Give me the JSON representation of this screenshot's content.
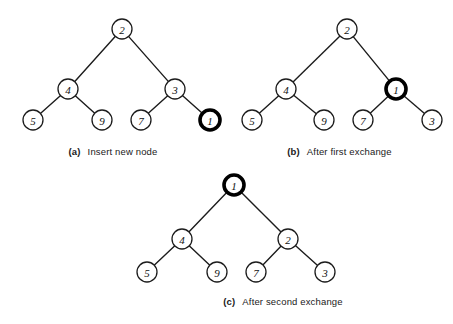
{
  "figure": {
    "type": "diagram",
    "background_color": "#ffffff",
    "node_stroke_color": "#1c1c1c",
    "node_fill_color": "#ffffff",
    "highlight_stroke_color": "#000000",
    "edge_color": "#1c1c1c"
  },
  "panels": [
    {
      "id": "a",
      "caption_tag": "(a)",
      "caption_text": "Insert new node",
      "width": 226,
      "height": 162,
      "nodes": [
        {
          "id": "a-root",
          "label": "2",
          "x": 122,
          "y": 29,
          "r": 10,
          "highlighted": false
        },
        {
          "id": "a-n4",
          "label": "4",
          "x": 68,
          "y": 89,
          "r": 10,
          "highlighted": false
        },
        {
          "id": "a-n3",
          "label": "3",
          "x": 175,
          "y": 89,
          "r": 10,
          "highlighted": false
        },
        {
          "id": "a-n5",
          "label": "5",
          "x": 33,
          "y": 120,
          "r": 10,
          "highlighted": false
        },
        {
          "id": "a-n9",
          "label": "9",
          "x": 102,
          "y": 120,
          "r": 10,
          "highlighted": false
        },
        {
          "id": "a-n7",
          "label": "7",
          "x": 141,
          "y": 120,
          "r": 10,
          "highlighted": false
        },
        {
          "id": "a-n1",
          "label": "1",
          "x": 210,
          "y": 120,
          "r": 10,
          "highlighted": true
        }
      ],
      "edges": [
        {
          "from": "a-root",
          "to": "a-n4"
        },
        {
          "from": "a-root",
          "to": "a-n3"
        },
        {
          "from": "a-n4",
          "to": "a-n5"
        },
        {
          "from": "a-n4",
          "to": "a-n9"
        },
        {
          "from": "a-n3",
          "to": "a-n7"
        },
        {
          "from": "a-n3",
          "to": "a-n1"
        }
      ]
    },
    {
      "id": "b",
      "caption_tag": "(b)",
      "caption_text": "After first exchange",
      "width": 227,
      "height": 162,
      "nodes": [
        {
          "id": "b-root",
          "label": "2",
          "x": 121,
          "y": 29,
          "r": 10,
          "highlighted": false
        },
        {
          "id": "b-n4",
          "label": "4",
          "x": 60,
          "y": 89,
          "r": 10,
          "highlighted": false
        },
        {
          "id": "b-n1",
          "label": "1",
          "x": 170,
          "y": 89,
          "r": 10,
          "highlighted": true
        },
        {
          "id": "b-n5",
          "label": "5",
          "x": 26,
          "y": 120,
          "r": 10,
          "highlighted": false
        },
        {
          "id": "b-n9",
          "label": "9",
          "x": 98,
          "y": 120,
          "r": 10,
          "highlighted": false
        },
        {
          "id": "b-n7",
          "label": "7",
          "x": 137,
          "y": 120,
          "r": 10,
          "highlighted": false
        },
        {
          "id": "b-n3",
          "label": "3",
          "x": 206,
          "y": 120,
          "r": 10,
          "highlighted": false
        }
      ],
      "edges": [
        {
          "from": "b-root",
          "to": "b-n4"
        },
        {
          "from": "b-root",
          "to": "b-n1"
        },
        {
          "from": "b-n4",
          "to": "b-n5"
        },
        {
          "from": "b-n4",
          "to": "b-n9"
        },
        {
          "from": "b-n1",
          "to": "b-n7"
        },
        {
          "from": "b-n1",
          "to": "b-n3"
        }
      ]
    },
    {
      "id": "c",
      "caption_tag": "(c)",
      "caption_text": "After second exchange",
      "width": 340,
      "height": 162,
      "nodes": [
        {
          "id": "c-root",
          "label": "1",
          "x": 121,
          "y": 23,
          "r": 10,
          "highlighted": true
        },
        {
          "id": "c-n4",
          "label": "4",
          "x": 69,
          "y": 77,
          "r": 10,
          "highlighted": false
        },
        {
          "id": "c-n2",
          "label": "2",
          "x": 175,
          "y": 77,
          "r": 10,
          "highlighted": false
        },
        {
          "id": "c-n5",
          "label": "5",
          "x": 34,
          "y": 110,
          "r": 10,
          "highlighted": false
        },
        {
          "id": "c-n9",
          "label": "9",
          "x": 104,
          "y": 110,
          "r": 10,
          "highlighted": false
        },
        {
          "id": "c-n7",
          "label": "7",
          "x": 143,
          "y": 110,
          "r": 10,
          "highlighted": false
        },
        {
          "id": "c-n3",
          "label": "3",
          "x": 212,
          "y": 110,
          "r": 10,
          "highlighted": false
        }
      ],
      "edges": [
        {
          "from": "c-root",
          "to": "c-n4"
        },
        {
          "from": "c-root",
          "to": "c-n2"
        },
        {
          "from": "c-n4",
          "to": "c-n5"
        },
        {
          "from": "c-n4",
          "to": "c-n9"
        },
        {
          "from": "c-n2",
          "to": "c-n7"
        },
        {
          "from": "c-n2",
          "to": "c-n3"
        }
      ]
    }
  ]
}
